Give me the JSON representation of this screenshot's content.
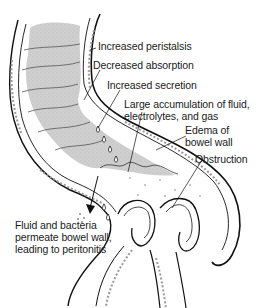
{
  "diagram": {
    "labels": [
      {
        "id": "peristalsis",
        "text": "Increased peristalsis"
      },
      {
        "id": "absorption",
        "text": "Decreased absorption"
      },
      {
        "id": "secretion",
        "text": "Increased secretion"
      },
      {
        "id": "accumulation",
        "line1": "Large accumulation of fluid,",
        "line2": "electrolytes, and gas"
      },
      {
        "id": "edema",
        "line1": "Edema of",
        "line2": "bowel wall"
      },
      {
        "id": "obstruction",
        "text": "Obstruction"
      },
      {
        "id": "peritonitis",
        "line1": "Fluid and bacteria",
        "line2": "permeate bowel wall,",
        "line3": "leading to peritonitis"
      }
    ],
    "colors": {
      "line": "#111111",
      "fluid_fill": "#c8c8c8",
      "wall_texture": "#9a9a9a",
      "background": "#ffffff"
    }
  }
}
